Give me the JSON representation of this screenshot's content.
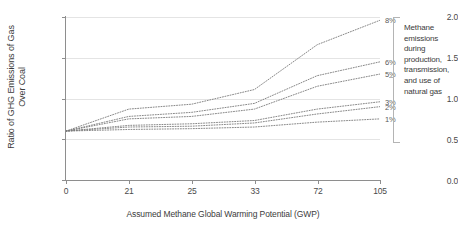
{
  "chart_data": {
    "type": "line",
    "title": "",
    "xlabel": "Assumed Methane Global Warming Potential (GWP)",
    "ylabel": "Ratio of GHG Emissions of Gas Over Coal",
    "x_tick_labels": [
      "0",
      "21",
      "25",
      "33",
      "72",
      "105"
    ],
    "x_axis_kind": "ordinal",
    "y_ticks": [
      "0.0",
      "0.5",
      "1.0",
      "1.5",
      "2.0"
    ],
    "ylim": [
      0.0,
      2.0
    ],
    "grid": "horizontal",
    "legend_position": "right",
    "line_style": "dotted",
    "series": [
      {
        "name": "8%",
        "values": [
          0.6,
          0.87,
          0.93,
          1.11,
          1.66,
          1.96
        ]
      },
      {
        "name": "6%",
        "values": [
          0.6,
          0.78,
          0.83,
          0.94,
          1.28,
          1.45
        ]
      },
      {
        "name": "5%",
        "values": [
          0.6,
          0.75,
          0.78,
          0.87,
          1.15,
          1.3
        ]
      },
      {
        "name": "3%",
        "values": [
          0.6,
          0.67,
          0.69,
          0.73,
          0.87,
          0.96
        ]
      },
      {
        "name": "2%",
        "values": [
          0.6,
          0.65,
          0.66,
          0.7,
          0.81,
          0.9
        ]
      },
      {
        "name": "1%",
        "values": [
          0.6,
          0.62,
          0.63,
          0.65,
          0.71,
          0.75
        ]
      }
    ],
    "annotation": "Methane emissions during production, transmission, and use of natural gas",
    "colors": {
      "grid": "#e4e4e4",
      "axis": "#8e8e8e",
      "series": "#7a7a7a",
      "text": "#3b3b3b"
    }
  }
}
